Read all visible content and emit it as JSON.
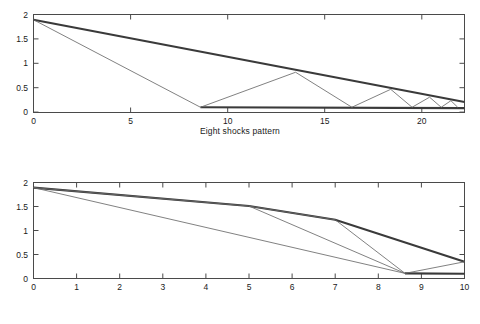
{
  "figure": {
    "background": "#ffffff",
    "axis_color": "#4a4a4a",
    "envelope_color": "#3a3a3a",
    "characteristic_color": "#6a6a6a"
  },
  "panels": [
    {
      "id": "eight-shocks",
      "caption": "Eight shocks pattern",
      "chart_data": {
        "type": "line",
        "title": "",
        "xlabel": "",
        "ylabel": "",
        "xlim": [
          0,
          22.2
        ],
        "ylim": [
          -0.12,
          2.12
        ],
        "xticks": [
          0,
          5,
          10,
          15,
          20
        ],
        "yticks": [
          0,
          0.5,
          1,
          1.5,
          2
        ],
        "xticklabels": [
          "0",
          "5",
          "10",
          "15",
          "20"
        ],
        "yticklabels": [
          "0",
          "0.5",
          "1",
          "1.5",
          "2"
        ],
        "grid": false,
        "legend": "none",
        "series": [
          {
            "name": "upper envelope (shock locus)",
            "style": "bold",
            "points": [
              [
                0,
                2.0
              ],
              [
                22.2,
                0.12
              ]
            ]
          },
          {
            "name": "lower envelope (axis shock)",
            "style": "bold",
            "points": [
              [
                8.6,
                0.0
              ],
              [
                22.2,
                -0.02
              ]
            ]
          },
          {
            "name": "characteristic 1",
            "style": "thin",
            "points": [
              [
                0,
                2.0
              ],
              [
                8.6,
                0.0
              ]
            ]
          },
          {
            "name": "characteristic 2",
            "style": "thin",
            "points": [
              [
                8.6,
                0.0
              ],
              [
                13.5,
                0.8
              ],
              [
                16.4,
                0.0
              ]
            ]
          },
          {
            "name": "characteristic 3",
            "style": "thin",
            "points": [
              [
                16.4,
                0.0
              ],
              [
                18.4,
                0.41
              ],
              [
                19.5,
                0.0
              ]
            ]
          },
          {
            "name": "characteristic 4",
            "style": "thin",
            "points": [
              [
                19.5,
                0.0
              ],
              [
                20.4,
                0.23
              ],
              [
                21.0,
                0.0
              ]
            ]
          },
          {
            "name": "characteristic 5",
            "style": "thin",
            "points": [
              [
                21.0,
                0.0
              ],
              [
                21.5,
                0.15
              ],
              [
                21.85,
                0.0
              ]
            ]
          }
        ]
      }
    },
    {
      "id": "four-shocks",
      "caption": "Four shocks pattern",
      "chart_data": {
        "type": "line",
        "title": "",
        "xlabel": "",
        "ylabel": "",
        "xlim": [
          0,
          10
        ],
        "ylim": [
          -0.12,
          2.12
        ],
        "xticks": [
          0,
          1,
          2,
          3,
          4,
          5,
          6,
          7,
          8,
          9,
          10
        ],
        "yticks": [
          0,
          0.5,
          1,
          1.5,
          2
        ],
        "xticklabels": [
          "0",
          "1",
          "2",
          "3",
          "4",
          "5",
          "6",
          "7",
          "8",
          "9",
          "10"
        ],
        "yticklabels": [
          "0",
          "0.5",
          "1",
          "1.5",
          "2"
        ],
        "grid": false,
        "legend": "none",
        "series": [
          {
            "name": "upper envelope (shock locus)",
            "style": "bold",
            "points": [
              [
                0,
                2.0
              ],
              [
                5.0,
                1.57
              ],
              [
                7.0,
                1.25
              ],
              [
                10.0,
                0.27
              ]
            ]
          },
          {
            "name": "lower envelope (axis shock)",
            "style": "bold",
            "points": [
              [
                8.62,
                0.0
              ],
              [
                10.0,
                -0.01
              ]
            ]
          },
          {
            "name": "characteristic 1",
            "style": "thin",
            "points": [
              [
                0,
                2.0
              ],
              [
                8.62,
                0.0
              ]
            ]
          },
          {
            "name": "characteristic 2",
            "style": "thin",
            "points": [
              [
                0,
                2.0
              ],
              [
                5.0,
                1.57
              ],
              [
                8.62,
                0.0
              ]
            ]
          },
          {
            "name": "characteristic 3",
            "style": "thin",
            "points": [
              [
                5.0,
                1.57
              ],
              [
                7.0,
                1.25
              ],
              [
                8.62,
                0.0
              ]
            ]
          },
          {
            "name": "characteristic 4",
            "style": "thin",
            "points": [
              [
                8.62,
                0.0
              ],
              [
                10.0,
                0.27
              ]
            ]
          }
        ]
      }
    }
  ]
}
